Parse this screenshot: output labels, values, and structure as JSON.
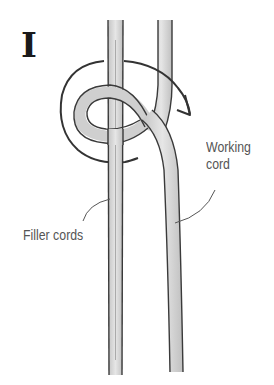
{
  "figure": {
    "step_label": "I",
    "labels": {
      "working_cord": [
        "Working",
        "cord"
      ],
      "filler_cords": "Filler cords"
    },
    "colors": {
      "outline": "#3a3a3a",
      "cord_fill": "#d9d9d9",
      "cord_shade": "#b8b8b8",
      "arrow": "#333333",
      "label_text": "#555555",
      "leader_line": "#555555"
    }
  }
}
